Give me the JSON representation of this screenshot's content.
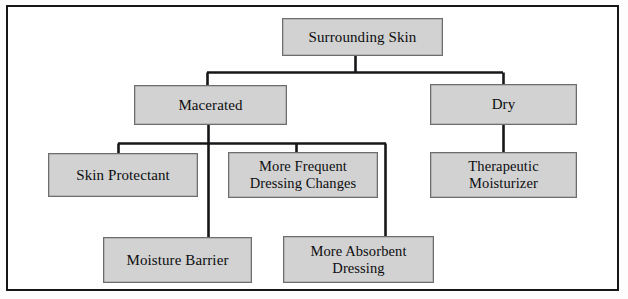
{
  "diagram": {
    "type": "flowchart",
    "colors": {
      "node_fill": "#d2d2d2",
      "node_border": "#6d6d6d",
      "connector": "#17171a",
      "frame": "#17171a",
      "background": "#ffffff",
      "text": "#0d0d0f"
    },
    "nodes": [
      {
        "id": "surrounding_skin",
        "label": "Surrounding Skin",
        "level": 0,
        "x": 282,
        "y": 18,
        "w": 161,
        "h": 38
      },
      {
        "id": "macerated",
        "label": "Macerated",
        "level": 1,
        "x": 134,
        "y": 85,
        "w": 153,
        "h": 40
      },
      {
        "id": "dry",
        "label": "Dry",
        "level": 1,
        "x": 430,
        "y": 84,
        "w": 147,
        "h": 41
      },
      {
        "id": "skin_protectant",
        "label": "Skin Protectant",
        "level": 2,
        "x": 48,
        "y": 153,
        "w": 150,
        "h": 44
      },
      {
        "id": "more_frequent_dressing",
        "label": "More Frequent\nDressing Changes",
        "level": 2,
        "x": 228,
        "y": 152,
        "w": 150,
        "h": 46
      },
      {
        "id": "therapeutic_moisturizer",
        "label": "Therapeutic\nMoisturizer",
        "level": 2,
        "x": 430,
        "y": 152,
        "w": 147,
        "h": 46
      },
      {
        "id": "moisture_barrier",
        "label": "Moisture Barrier",
        "level": 3,
        "x": 103,
        "y": 237,
        "w": 149,
        "h": 46
      },
      {
        "id": "more_absorbent_dressing",
        "label": "More Absorbent\nDressing",
        "level": 3,
        "x": 283,
        "y": 236,
        "w": 151,
        "h": 47
      }
    ],
    "edges": [
      {
        "from": "surrounding_skin",
        "to": "macerated"
      },
      {
        "from": "surrounding_skin",
        "to": "dry"
      },
      {
        "from": "macerated",
        "to": "skin_protectant"
      },
      {
        "from": "macerated",
        "to": "more_frequent_dressing"
      },
      {
        "from": "macerated",
        "to": "moisture_barrier"
      },
      {
        "from": "macerated",
        "to": "more_absorbent_dressing"
      },
      {
        "from": "dry",
        "to": "therapeutic_moisturizer"
      }
    ]
  }
}
